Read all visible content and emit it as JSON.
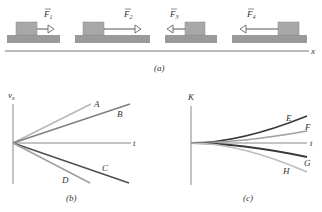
{
  "panel_a": {
    "caption": "(a)",
    "axis_label": "x",
    "forces": [
      {
        "label": "F",
        "sub": "1",
        "direction": "right",
        "length": "short"
      },
      {
        "label": "F",
        "sub": "2",
        "direction": "right",
        "length": "long"
      },
      {
        "label": "F",
        "sub": "3",
        "direction": "left",
        "length": "short"
      },
      {
        "label": "F",
        "sub": "4",
        "direction": "left",
        "length": "long"
      }
    ]
  },
  "panel_b": {
    "caption": "(b)",
    "y_label": "v",
    "y_sub": "x",
    "x_label": "t",
    "lines": [
      "A",
      "B",
      "C",
      "D"
    ]
  },
  "panel_c": {
    "caption": "(c)",
    "y_label": "K",
    "x_label": "t",
    "curves": [
      "E",
      "F",
      "G",
      "H"
    ]
  },
  "colors": {
    "block": "#a8a8a8",
    "ground": "#9a9a9a",
    "axis": "#777777",
    "dark": "#444444",
    "medium": "#808080",
    "light": "#b8b8b8"
  }
}
